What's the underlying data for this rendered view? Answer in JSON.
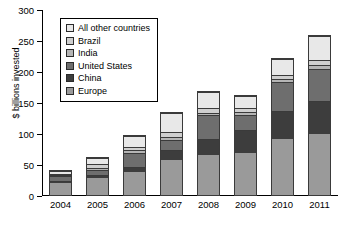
{
  "chart_data": {
    "type": "bar",
    "stacked": true,
    "title": "",
    "xlabel": "",
    "ylabel": "$ billions invested",
    "ylim": [
      0,
      300
    ],
    "yticks": [
      0,
      50,
      100,
      150,
      200,
      250,
      300
    ],
    "grid": false,
    "legend_position": "upper-left-inset",
    "categories": [
      "2004",
      "2005",
      "2006",
      "2007",
      "2008",
      "2009",
      "2010",
      "2011"
    ],
    "legend_order_top_to_bottom": [
      "All other countries",
      "Brazil",
      "India",
      "United States",
      "China",
      "Europe"
    ],
    "stack_order_bottom_to_top": [
      "Europe",
      "China",
      "United States",
      "India",
      "Brazil",
      "All other countries"
    ],
    "series": [
      {
        "name": "Europe",
        "color": "#9a9a9a",
        "values": [
          19,
          28,
          37,
          57,
          65,
          67,
          91,
          99
        ]
      },
      {
        "name": "China",
        "color": "#3d3d3d",
        "values": [
          3,
          5,
          8,
          16,
          26,
          38,
          45,
          53
        ]
      },
      {
        "name": "United States",
        "color": "#6e6e6e",
        "values": [
          8,
          8,
          22,
          16,
          38,
          24,
          46,
          51
        ]
      },
      {
        "name": "India",
        "color": "#b5b5b5",
        "values": [
          2,
          3,
          5,
          5,
          4,
          5,
          5,
          6
        ]
      },
      {
        "name": "Brazil",
        "color": "#cfcfcf",
        "values": [
          2,
          6,
          6,
          7,
          8,
          6,
          6,
          8
        ]
      },
      {
        "name": "All other countries",
        "color": "#e8e8e8",
        "values": [
          5,
          10,
          18,
          31,
          25,
          20,
          26,
          39
        ]
      }
    ],
    "totals": [
      39,
      60,
      96,
      132,
      166,
      160,
      219,
      256
    ]
  }
}
